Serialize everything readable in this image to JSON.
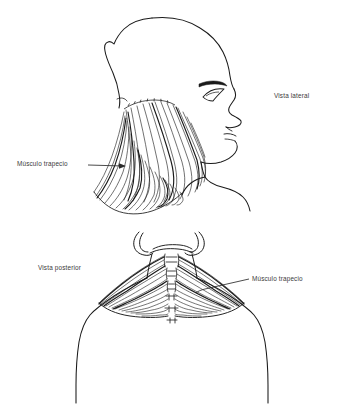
{
  "figure": {
    "background_color": "#ffffff",
    "ink_color": "#1a1a1a",
    "text_color": "#3a3a3a",
    "width": 338,
    "height": 411
  },
  "labels": {
    "vista_lateral": "Vista lateral",
    "musculo_trapecio_lateral": "Músculo trapecio",
    "vista_posterior": "Vista posterior",
    "musculo_trapecio_posterior": "Músculo trapecio"
  },
  "views": {
    "lateral": {
      "name": "Vista lateral",
      "subject": "cabeza y cuello de perfil mirando a la derecha",
      "structures": [
        "cráneo",
        "ceja",
        "ojo",
        "nariz",
        "labios",
        "mentón",
        "cuello",
        "hombro",
        "músculo trapecio"
      ],
      "leader": {
        "from_x": 88,
        "from_y": 165,
        "to_x": 126,
        "to_y": 166,
        "arrowhead": "right"
      }
    },
    "posterior": {
      "name": "Vista posterior",
      "subject": "cuello y hombros vistos desde atrás",
      "structures": [
        "occipucio",
        "orejas",
        "apófisis espinosas cervicales",
        "músculo trapecio",
        "hombros",
        "acromion"
      ],
      "leader": {
        "from_x": 249,
        "from_y": 279,
        "to_x": 197,
        "to_y": 292,
        "arrowhead": "left"
      }
    }
  }
}
